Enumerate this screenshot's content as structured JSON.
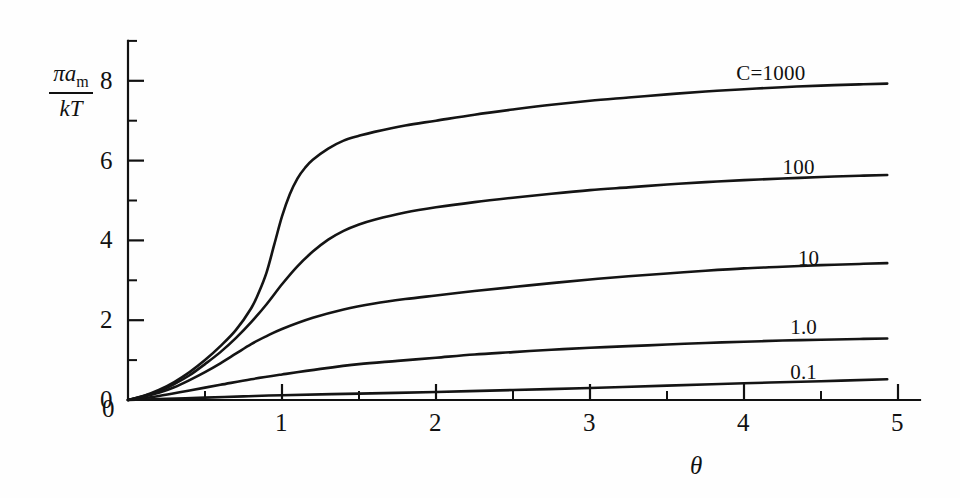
{
  "chart_data": {
    "type": "line",
    "title": "",
    "xlabel": "θ",
    "ylabel_numerator": "πa",
    "ylabel_numerator_sub": "m",
    "ylabel_denominator": "kT",
    "xlim": [
      0,
      5
    ],
    "ylim": [
      0,
      9
    ],
    "grid": false,
    "legend_position": "inline-right",
    "x_ticks_major": [
      0,
      1,
      2,
      3,
      4,
      5
    ],
    "x_ticks_major_labels": [
      "0",
      "1",
      "2",
      "3",
      "4",
      "5"
    ],
    "x_ticks_minor": [
      0.5,
      1.5,
      2.5,
      3.5,
      4.5
    ],
    "y_ticks_major": [
      0,
      2,
      4,
      6,
      8
    ],
    "y_ticks_major_labels": [
      "0",
      "2",
      "4",
      "6",
      "8"
    ],
    "y_ticks_minor": [
      1,
      3,
      5,
      7,
      9
    ],
    "series": [
      {
        "name": "C = 1000",
        "label": "C=1000",
        "label_x": 3.95,
        "label_y": 8.45,
        "x": [
          0,
          0.1,
          0.2,
          0.3,
          0.4,
          0.5,
          0.6,
          0.7,
          0.8,
          0.85,
          0.9,
          0.95,
          1.0,
          1.05,
          1.1,
          1.15,
          1.2,
          1.3,
          1.4,
          1.5,
          1.6,
          1.8,
          2.0,
          2.25,
          2.5,
          2.75,
          3.0,
          3.25,
          3.5,
          3.75,
          4.0,
          4.25,
          4.5,
          4.75,
          4.93
        ],
        "y": [
          0,
          0.1,
          0.25,
          0.45,
          0.7,
          1.0,
          1.35,
          1.75,
          2.3,
          2.7,
          3.2,
          3.9,
          4.6,
          5.15,
          5.55,
          5.82,
          6.02,
          6.3,
          6.5,
          6.62,
          6.72,
          6.88,
          7.0,
          7.15,
          7.28,
          7.4,
          7.5,
          7.58,
          7.66,
          7.73,
          7.79,
          7.84,
          7.88,
          7.91,
          7.93
        ]
      },
      {
        "name": "C = 100",
        "label": "100",
        "label_x": 4.25,
        "label_y": 6.1,
        "x": [
          0,
          0.1,
          0.2,
          0.3,
          0.4,
          0.5,
          0.6,
          0.7,
          0.8,
          0.9,
          1.0,
          1.1,
          1.2,
          1.3,
          1.4,
          1.5,
          1.6,
          1.8,
          2.0,
          2.25,
          2.5,
          2.75,
          3.0,
          3.25,
          3.5,
          3.75,
          4.0,
          4.25,
          4.5,
          4.75,
          4.93
        ],
        "y": [
          0,
          0.1,
          0.22,
          0.4,
          0.62,
          0.9,
          1.2,
          1.55,
          1.95,
          2.4,
          2.9,
          3.35,
          3.72,
          4.02,
          4.24,
          4.4,
          4.52,
          4.7,
          4.83,
          4.96,
          5.07,
          5.17,
          5.26,
          5.33,
          5.4,
          5.46,
          5.51,
          5.55,
          5.59,
          5.62,
          5.64
        ]
      },
      {
        "name": "C = 10",
        "label": "10",
        "label_x": 4.35,
        "label_y": 3.82,
        "x": [
          0,
          0.1,
          0.2,
          0.3,
          0.4,
          0.5,
          0.6,
          0.7,
          0.8,
          0.9,
          1.0,
          1.2,
          1.4,
          1.6,
          1.8,
          2.0,
          2.25,
          2.5,
          2.75,
          3.0,
          3.25,
          3.5,
          3.75,
          4.0,
          4.25,
          4.5,
          4.75,
          4.93
        ],
        "y": [
          0,
          0.08,
          0.18,
          0.32,
          0.5,
          0.7,
          0.92,
          1.16,
          1.4,
          1.6,
          1.78,
          2.06,
          2.27,
          2.42,
          2.53,
          2.62,
          2.73,
          2.83,
          2.93,
          3.02,
          3.1,
          3.17,
          3.24,
          3.3,
          3.34,
          3.38,
          3.41,
          3.43
        ]
      },
      {
        "name": "C = 1.0",
        "label": "1.0",
        "label_x": 4.3,
        "label_y": 2.08,
        "x": [
          0,
          0.2,
          0.4,
          0.6,
          0.8,
          1.0,
          1.25,
          1.5,
          1.75,
          2.0,
          2.25,
          2.5,
          2.75,
          3.0,
          3.25,
          3.5,
          3.75,
          4.0,
          4.25,
          4.5,
          4.75,
          4.93
        ],
        "y": [
          0,
          0.1,
          0.24,
          0.38,
          0.52,
          0.64,
          0.78,
          0.9,
          0.98,
          1.06,
          1.14,
          1.2,
          1.26,
          1.31,
          1.35,
          1.39,
          1.43,
          1.46,
          1.49,
          1.51,
          1.53,
          1.54
        ]
      },
      {
        "name": "C = 0.1",
        "label": "0.1",
        "label_x": 4.3,
        "label_y": 0.95,
        "x": [
          0,
          0.25,
          0.5,
          0.75,
          1.0,
          1.5,
          2.0,
          2.5,
          3.0,
          3.5,
          4.0,
          4.5,
          4.93
        ],
        "y": [
          0,
          0.03,
          0.06,
          0.09,
          0.12,
          0.16,
          0.2,
          0.25,
          0.3,
          0.36,
          0.42,
          0.47,
          0.52
        ]
      }
    ]
  },
  "axis": {
    "x_label": "θ",
    "y_label_numerator": "πa",
    "y_label_numerator_sub": "m",
    "y_label_denominator": "kT"
  }
}
